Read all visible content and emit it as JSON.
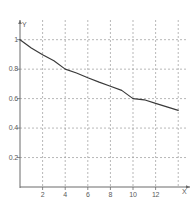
{
  "chart_data": {
    "type": "line",
    "title": "",
    "subtitle": "",
    "xlabel": "X",
    "ylabel": "Y",
    "xlim": [
      0,
      14.6
    ],
    "ylim": [
      0,
      1.12
    ],
    "grid": true,
    "grid_style": "dashed",
    "legend": null,
    "x_ticks": [
      2,
      4,
      6,
      8,
      10,
      12
    ],
    "x_tick_labels": [
      "2",
      "4",
      "6",
      "8",
      "10",
      "12"
    ],
    "x_gridlines": [
      2,
      4,
      6,
      8,
      10,
      12,
      14
    ],
    "y_ticks": [
      0.2,
      0.4,
      0.6,
      0.8,
      1
    ],
    "y_tick_labels": [
      "0.2",
      "0.4",
      "0.6",
      "0.8",
      "1"
    ],
    "y_gridlines": [
      0.2,
      0.4,
      0.6,
      0.8,
      1.0
    ],
    "series": [
      {
        "name": "curve",
        "color": "#3a3a3a",
        "x": [
          0,
          1,
          2,
          3,
          4,
          5,
          6,
          7,
          8,
          9,
          10,
          11,
          12,
          13,
          14
        ],
        "y": [
          1.0,
          0.944,
          0.898,
          0.857,
          0.8,
          0.774,
          0.742,
          0.712,
          0.684,
          0.656,
          0.6,
          0.592,
          0.568,
          0.544,
          0.52
        ]
      }
    ]
  },
  "axes": {
    "y_axis_name": "Y",
    "x_axis_name": "X"
  },
  "colors": {
    "background": "#ffffff",
    "grid": "#9a9a9a",
    "axis": "#6b6b6b",
    "curve": "#3a3a3a",
    "text": "#5a5a5a"
  }
}
